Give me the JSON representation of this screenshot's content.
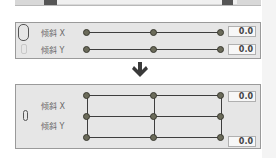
{
  "top_panel": {
    "handles": 2
  },
  "panel_unlinked": {
    "link_state": "unlinked",
    "rows": [
      {
        "label": "倾斜 X",
        "value": "0.0"
      },
      {
        "label": "倾斜 Y",
        "value": "0.0"
      }
    ]
  },
  "arrow": {
    "icon": "arrow-down-icon"
  },
  "panel_linked": {
    "link_state": "linked",
    "rows": [
      {
        "label": "倾斜 X",
        "value": "0.0"
      },
      {
        "label": "倾斜 Y",
        "value": "0.0"
      }
    ]
  }
}
